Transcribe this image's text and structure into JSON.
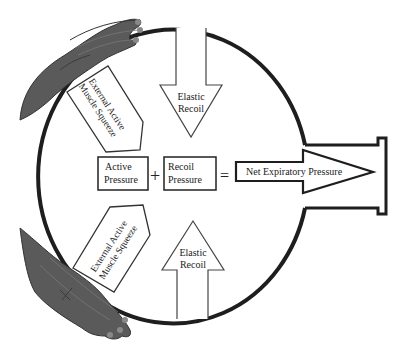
{
  "diagram": {
    "colors": {
      "outline": "#1e1e1e",
      "background": "#ffffff",
      "hand": "#5a5a5a",
      "hand_dark": "#333333",
      "text": "#222222"
    },
    "top_arrow": {
      "line1": "Elastic",
      "line2": "Recoil",
      "direction": "down"
    },
    "bottom_arrow": {
      "line1": "Elastic",
      "line2": "Recoil",
      "direction": "up"
    },
    "upper_squeeze_arrow": {
      "line1": "External Active",
      "line2": "Muscle Squeeze"
    },
    "lower_squeeze_arrow": {
      "line1": "External Active",
      "line2": "Muscle Squeeze"
    },
    "equation": {
      "term1": {
        "line1": "Active",
        "line2": "Pressure"
      },
      "plus": "+",
      "term2": {
        "line1": "Recoil",
        "line2": "Pressure"
      },
      "equals": "=",
      "result": "Net Expiratory Pressure"
    },
    "hands": [
      "upper-hand",
      "lower-hand"
    ]
  }
}
